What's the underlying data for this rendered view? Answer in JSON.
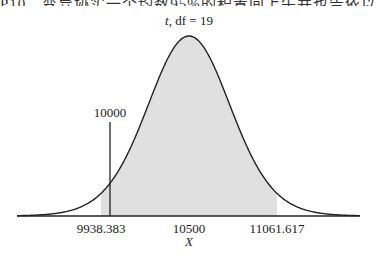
{
  "caption_fragment": "P10　变异协实一个均数95%的积置间上午并也告依以值10",
  "chart_data": {
    "type": "area",
    "title": "t, df = 19",
    "distribution": "t",
    "df": 19,
    "xlabel": "X",
    "ylabel": "",
    "x_ticks": [
      "9938.383",
      "10500",
      "11061.617"
    ],
    "mean": 10500,
    "confidence_interval": [
      9938.383,
      11061.617
    ],
    "shaded_region": {
      "from": 9938.383,
      "to": 11061.617,
      "color": "#e0e0e0"
    },
    "reference_line": {
      "value": 10000,
      "label": "10000"
    },
    "grid": false,
    "legend": "none"
  },
  "labels": {
    "title_t": "t",
    "title_rest": ", df = 19",
    "tick_left": "9938.383",
    "tick_mid": "10500",
    "tick_right": "11061.617",
    "xlabel": "X",
    "ref_label": "10000"
  },
  "colors": {
    "curve": "#222222",
    "shade": "#e0e0e0",
    "axis": "#222222"
  }
}
